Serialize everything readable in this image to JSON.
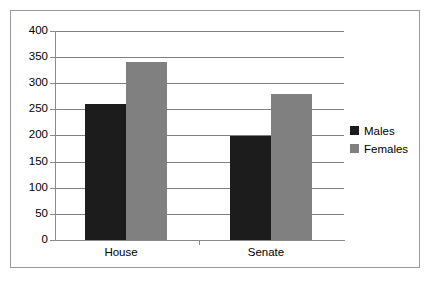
{
  "chart_data": {
    "type": "bar",
    "title": "",
    "xlabel": "",
    "ylabel": "",
    "categories": [
      "House",
      "Senate"
    ],
    "series": [
      {
        "name": "Males",
        "color": "#1c1c1c",
        "values": [
          260,
          200
        ]
      },
      {
        "name": "Females",
        "color": "#808080",
        "values": [
          340,
          280
        ]
      }
    ],
    "ylim": [
      0,
      400
    ],
    "ytick_labels": [
      "400",
      "350",
      "300",
      "250",
      "200",
      "150",
      "100",
      "50",
      "0"
    ],
    "ytick_values": [
      400,
      350,
      300,
      250,
      200,
      150,
      100,
      50,
      0
    ],
    "grid": true,
    "legend_position": "right"
  },
  "legend": {
    "entries": [
      {
        "label": "Males",
        "color": "#1c1c1c"
      },
      {
        "label": "Females",
        "color": "#808080"
      }
    ]
  },
  "axis": {
    "y_labels": {
      "t400": "400",
      "t350": "350",
      "t300": "300",
      "t250": "250",
      "t200": "200",
      "t150": "150",
      "t100": "100",
      "t50": "50",
      "t0": "0"
    },
    "x_labels": {
      "house": "House",
      "senate": "Senate"
    }
  }
}
